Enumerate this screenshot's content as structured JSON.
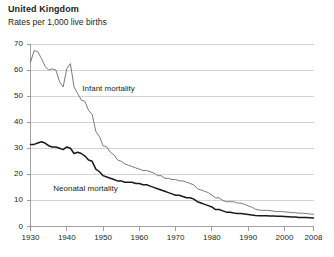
{
  "header": {
    "title": "United Kingdom",
    "subtitle": "Rates per 1,000 live births"
  },
  "labels": {
    "infant": "Infant mortality",
    "neonatal": "Neonatal mortality"
  },
  "chart_data": {
    "type": "line",
    "title": "United Kingdom",
    "subtitle": "Rates per 1,000 live births",
    "xlabel": "",
    "ylabel": "Rates per 1,000 live births",
    "xlim": [
      1930,
      2008
    ],
    "ylim": [
      0,
      70
    ],
    "ytick_values": [
      0,
      10,
      20,
      30,
      40,
      50,
      60,
      70
    ],
    "xtick_values": [
      1930,
      1940,
      1950,
      1960,
      1970,
      1980,
      1990,
      2000,
      2008
    ],
    "grid": "horizontal",
    "legend": "inline-annotations",
    "colors": {
      "infant": "#7a7a7a",
      "neonatal": "#1a1a1a",
      "grid": "#c9c9c9",
      "axis": "#8a8a8a"
    },
    "series": [
      {
        "name": "Infant mortality",
        "color": "#7a7a7a",
        "x": [
          1930,
          1931,
          1932,
          1933,
          1934,
          1935,
          1936,
          1937,
          1938,
          1939,
          1940,
          1941,
          1942,
          1943,
          1944,
          1945,
          1946,
          1947,
          1948,
          1949,
          1950,
          1951,
          1952,
          1953,
          1954,
          1955,
          1956,
          1957,
          1958,
          1959,
          1960,
          1961,
          1962,
          1963,
          1964,
          1965,
          1966,
          1967,
          1968,
          1969,
          1970,
          1971,
          1972,
          1973,
          1974,
          1975,
          1976,
          1977,
          1978,
          1979,
          1980,
          1981,
          1982,
          1983,
          1984,
          1985,
          1986,
          1987,
          1988,
          1989,
          1990,
          1991,
          1992,
          1993,
          1994,
          1995,
          1996,
          1997,
          1998,
          1999,
          2000,
          2001,
          2002,
          2003,
          2004,
          2005,
          2006,
          2007,
          2008
        ],
        "values": [
          63.0,
          67.5,
          67.0,
          64.5,
          61.5,
          60.0,
          60.5,
          60.0,
          55.5,
          53.5,
          60.5,
          62.5,
          53.5,
          51.0,
          48.5,
          48.0,
          44.5,
          43.0,
          36.5,
          34.5,
          31.0,
          30.5,
          28.5,
          27.5,
          25.5,
          25.0,
          24.0,
          23.5,
          23.0,
          22.5,
          22.0,
          21.5,
          21.5,
          21.0,
          20.5,
          19.5,
          19.5,
          18.5,
          18.5,
          18.0,
          18.0,
          17.5,
          17.5,
          17.0,
          16.5,
          16.0,
          14.5,
          14.0,
          13.5,
          13.0,
          12.0,
          11.0,
          11.0,
          10.0,
          9.5,
          9.5,
          9.5,
          9.0,
          9.0,
          8.5,
          7.9,
          7.4,
          6.6,
          6.3,
          6.2,
          6.2,
          6.1,
          5.9,
          5.7,
          5.8,
          5.6,
          5.5,
          5.3,
          5.3,
          5.1,
          5.1,
          5.0,
          4.8,
          4.7
        ]
      },
      {
        "name": "Neonatal mortality",
        "color": "#1a1a1a",
        "x": [
          1930,
          1931,
          1932,
          1933,
          1934,
          1935,
          1936,
          1937,
          1938,
          1939,
          1940,
          1941,
          1942,
          1943,
          1944,
          1945,
          1946,
          1947,
          1948,
          1949,
          1950,
          1951,
          1952,
          1953,
          1954,
          1955,
          1956,
          1957,
          1958,
          1959,
          1960,
          1961,
          1962,
          1963,
          1964,
          1965,
          1966,
          1967,
          1968,
          1969,
          1970,
          1971,
          1972,
          1973,
          1974,
          1975,
          1976,
          1977,
          1978,
          1979,
          1980,
          1981,
          1982,
          1983,
          1984,
          1985,
          1986,
          1987,
          1988,
          1989,
          1990,
          1991,
          1992,
          1993,
          1994,
          1995,
          1996,
          1997,
          1998,
          1999,
          2000,
          2001,
          2002,
          2003,
          2004,
          2005,
          2006,
          2007,
          2008
        ],
        "values": [
          31.5,
          31.5,
          32.0,
          32.5,
          32.0,
          31.0,
          30.5,
          30.5,
          30.0,
          29.5,
          30.5,
          30.0,
          28.0,
          28.5,
          28.0,
          27.0,
          25.5,
          25.0,
          22.0,
          21.0,
          19.5,
          19.0,
          18.5,
          18.0,
          17.5,
          17.5,
          17.0,
          17.0,
          17.0,
          16.5,
          16.5,
          16.0,
          16.0,
          15.5,
          15.0,
          14.5,
          14.0,
          13.5,
          13.0,
          12.5,
          12.0,
          12.0,
          11.5,
          11.0,
          11.0,
          10.5,
          9.5,
          9.0,
          8.5,
          8.0,
          7.5,
          6.5,
          6.5,
          6.0,
          5.5,
          5.5,
          5.2,
          5.0,
          5.0,
          4.8,
          4.6,
          4.4,
          4.2,
          4.1,
          4.1,
          4.1,
          4.0,
          4.0,
          3.9,
          3.9,
          3.8,
          3.7,
          3.6,
          3.6,
          3.5,
          3.5,
          3.5,
          3.4,
          3.3
        ]
      }
    ]
  }
}
